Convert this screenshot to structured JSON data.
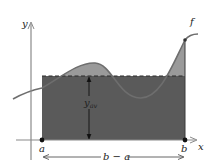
{
  "diagram": {
    "labels": {
      "y_axis": "y",
      "x_axis": "x",
      "function": "f",
      "a": "a",
      "b": "b",
      "y_av_main": "y",
      "y_av_sub": "av",
      "width": "b − a"
    },
    "colors": {
      "background": "#ffffff",
      "rectangle": "#5a5a5a",
      "area_above": "#9a9a9a",
      "curve": "#6e6e6e",
      "axis": "#8a8a8a",
      "dashed": "#2a2a2a",
      "point": "#111111",
      "arrow": "#444444"
    }
  }
}
